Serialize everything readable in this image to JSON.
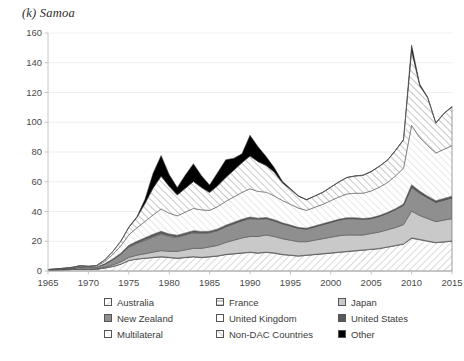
{
  "title": "(k) Samoa",
  "chart_data": {
    "type": "area",
    "title": "(k) Samoa",
    "xlabel": "",
    "ylabel": "",
    "stacked": true,
    "grid": true,
    "legend_position": "bottom",
    "ylim": [
      0,
      160
    ],
    "yticks": [
      0,
      20,
      40,
      60,
      80,
      100,
      120,
      140,
      160
    ],
    "xlim": [
      1965,
      2015
    ],
    "xticks": [
      1965,
      1970,
      1975,
      1980,
      1985,
      1990,
      1995,
      2000,
      2005,
      2010,
      2015
    ],
    "x": [
      1965,
      1966,
      1967,
      1968,
      1969,
      1970,
      1971,
      1972,
      1973,
      1974,
      1975,
      1976,
      1977,
      1978,
      1979,
      1980,
      1981,
      1982,
      1983,
      1984,
      1985,
      1986,
      1987,
      1988,
      1989,
      1990,
      1991,
      1992,
      1993,
      1994,
      1995,
      1996,
      1997,
      1998,
      1999,
      2000,
      2001,
      2002,
      2003,
      2004,
      2005,
      2006,
      2007,
      2008,
      2009,
      2010,
      2011,
      2012,
      2013,
      2014,
      2015
    ],
    "series": [
      {
        "name": "Australia",
        "fill": "hatch-diag-light",
        "values": [
          0.4,
          0.6,
          0.8,
          1.0,
          1.2,
          1.0,
          1.2,
          2.0,
          3.0,
          4.5,
          7.0,
          8.0,
          8.5,
          9.0,
          9.5,
          9.0,
          8.5,
          9.0,
          9.5,
          9.0,
          9.5,
          10.0,
          11.0,
          11.5,
          12.0,
          12.5,
          12.0,
          12.5,
          12.0,
          11.0,
          10.5,
          10.0,
          10.5,
          11.0,
          11.5,
          12.0,
          12.5,
          13.0,
          13.5,
          14.0,
          14.5,
          15.0,
          16.0,
          17.0,
          18.0,
          22.0,
          21.0,
          20.0,
          19.0,
          19.5,
          20.0
        ]
      },
      {
        "name": "France",
        "fill": "hatch-horiz",
        "values": [
          0,
          0,
          0,
          0,
          0,
          0,
          0,
          0,
          0,
          0.1,
          0.1,
          0.1,
          0.1,
          0.2,
          0.2,
          0.2,
          0.2,
          0.2,
          0.2,
          0.2,
          0.2,
          0.2,
          0.2,
          0.2,
          0.2,
          0.2,
          0.2,
          0.2,
          0.2,
          0.2,
          0.2,
          0.2,
          0.2,
          0.2,
          0.2,
          0.2,
          0.2,
          0.2,
          0.2,
          0.2,
          0.2,
          0.2,
          0.2,
          0.2,
          0.2,
          0.3,
          0.3,
          0.2,
          0.2,
          0.2,
          0.2
        ]
      },
      {
        "name": "Japan",
        "fill": "grey-light",
        "values": [
          0,
          0,
          0,
          0,
          0,
          0.2,
          0.3,
          0.5,
          1.0,
          1.5,
          2.0,
          2.5,
          3.0,
          3.5,
          4.0,
          4.0,
          4.5,
          5.0,
          5.5,
          6.0,
          6.5,
          7.0,
          8.0,
          9.0,
          10.0,
          10.5,
          11.0,
          11.5,
          11.0,
          10.5,
          10.0,
          9.5,
          9.0,
          9.5,
          10.0,
          10.5,
          11.0,
          11.0,
          10.5,
          10.0,
          10.5,
          11.0,
          11.5,
          12.0,
          13.0,
          18.0,
          16.0,
          15.0,
          14.0,
          14.5,
          15.0
        ]
      },
      {
        "name": "New Zealand",
        "fill": "grey-mid",
        "values": [
          0.3,
          0.4,
          0.5,
          0.8,
          1.5,
          1.2,
          1.0,
          2.0,
          3.5,
          5.0,
          7.0,
          8.0,
          9.0,
          10.0,
          11.0,
          10.0,
          9.5,
          10.0,
          10.5,
          10.0,
          9.5,
          10.0,
          10.5,
          11.0,
          11.5,
          12.0,
          11.5,
          11.0,
          10.5,
          10.0,
          9.5,
          9.0,
          8.5,
          9.0,
          9.5,
          10.0,
          10.5,
          11.0,
          11.0,
          10.5,
          10.0,
          10.5,
          11.0,
          12.0,
          13.0,
          16.0,
          15.0,
          14.0,
          13.0,
          13.5,
          14.0
        ]
      },
      {
        "name": "United Kingdom",
        "fill": "white",
        "values": [
          0,
          0,
          0,
          0,
          0,
          0,
          0,
          0.1,
          0.2,
          0.3,
          0.4,
          0.4,
          0.5,
          0.5,
          0.5,
          0.5,
          0.4,
          0.4,
          0.4,
          0.4,
          0.3,
          0.3,
          0.3,
          0.3,
          0.3,
          0.3,
          0.2,
          0.2,
          0.2,
          0.2,
          0.2,
          0.1,
          0.1,
          0.1,
          0.1,
          0.1,
          0.1,
          0.1,
          0.1,
          0.1,
          0.1,
          0.1,
          0.1,
          0.1,
          0.1,
          0.2,
          0.2,
          0.1,
          0.1,
          0.1,
          0.1
        ]
      },
      {
        "name": "United States",
        "fill": "grey-dark",
        "values": [
          0,
          0,
          0,
          0,
          0,
          0,
          0,
          0.2,
          0.3,
          0.5,
          0.8,
          1.0,
          1.2,
          1.5,
          1.5,
          1.2,
          1.0,
          1.0,
          1.0,
          1.0,
          0.8,
          0.8,
          0.8,
          0.8,
          0.8,
          0.8,
          0.6,
          0.6,
          0.6,
          0.5,
          0.5,
          0.5,
          0.5,
          0.5,
          0.5,
          0.5,
          0.5,
          0.5,
          0.5,
          0.5,
          0.5,
          0.5,
          0.6,
          0.6,
          0.8,
          1.5,
          1.2,
          1.0,
          1.0,
          1.0,
          1.0
        ]
      },
      {
        "name": "Multilateral",
        "fill": "white-diag",
        "values": [
          0.2,
          0.3,
          0.4,
          0.5,
          0.6,
          0.5,
          0.8,
          1.5,
          3.0,
          5.0,
          7.0,
          9.0,
          11.0,
          13.0,
          15.0,
          14.0,
          13.0,
          14.0,
          15.0,
          14.5,
          14.0,
          15.0,
          16.0,
          17.0,
          18.0,
          19.0,
          18.0,
          17.0,
          16.0,
          15.0,
          14.0,
          13.0,
          12.0,
          12.5,
          13.0,
          14.0,
          15.0,
          16.0,
          16.5,
          17.0,
          18.0,
          19.0,
          20.0,
          22.0,
          24.0,
          40.0,
          36.0,
          34.0,
          32.0,
          33.0,
          34.0
        ]
      },
      {
        "name": "Non-DAC Countries",
        "fill": "hatch-horiz2",
        "values": [
          0.1,
          0.1,
          0.2,
          0.2,
          0.3,
          0.3,
          0.4,
          1.0,
          2.0,
          3.0,
          5.0,
          7.0,
          12.0,
          18.0,
          22.0,
          18.0,
          14.0,
          16.0,
          18.0,
          15.0,
          12.0,
          14.0,
          16.0,
          18.0,
          20.0,
          22.0,
          20.0,
          18.0,
          16.0,
          12.0,
          10.0,
          8.0,
          7.0,
          7.5,
          8.0,
          9.0,
          10.0,
          11.0,
          11.5,
          12.0,
          13.0,
          14.0,
          15.0,
          17.0,
          19.0,
          50.0,
          35.0,
          32.0,
          20.0,
          24.0,
          26.0
        ]
      },
      {
        "name": "Other",
        "fill": "black",
        "values": [
          0,
          0,
          0,
          0,
          0,
          0,
          0,
          0,
          0,
          0,
          0.2,
          0.5,
          3.0,
          10.0,
          14.0,
          8.0,
          5.0,
          9.0,
          12.0,
          8.0,
          5.0,
          9.0,
          12.0,
          8.0,
          6.0,
          14.0,
          10.0,
          6.0,
          3.0,
          1.0,
          0.5,
          0.3,
          0.2,
          0.2,
          0.2,
          0.2,
          0.2,
          0.2,
          0.2,
          0.2,
          0.2,
          0.2,
          0.2,
          0.2,
          0.3,
          4.0,
          1.0,
          0.5,
          0.3,
          0.3,
          0.3
        ]
      }
    ]
  },
  "legend": {
    "items": [
      {
        "label": "Australia",
        "swatch": "hatch-diag-light"
      },
      {
        "label": "France",
        "swatch": "hatch-horiz"
      },
      {
        "label": "Japan",
        "swatch": "grey-light"
      },
      {
        "label": "New Zealand",
        "swatch": "grey-mid"
      },
      {
        "label": "United Kingdom",
        "swatch": "white"
      },
      {
        "label": "United States",
        "swatch": "grey-dark"
      },
      {
        "label": "Multilateral",
        "swatch": "white-diag"
      },
      {
        "label": "Non-DAC Countries",
        "swatch": "hatch-horiz2"
      },
      {
        "label": "Other",
        "swatch": "black"
      }
    ]
  },
  "colors": {
    "grey_light": "#c9c9c9",
    "grey_mid": "#8f8f8f",
    "grey_dark": "#5a5a5a",
    "black": "#000000",
    "white": "#ffffff",
    "axis": "#bfbfbf",
    "text": "#4a4a4a",
    "grid": "#e8e8e8"
  }
}
